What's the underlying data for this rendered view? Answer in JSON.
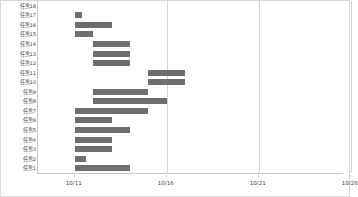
{
  "chart_data": {
    "type": "bar",
    "title": "",
    "subtitle": "",
    "xlabel": "",
    "ylabel": "",
    "orientation": "horizontal",
    "style": "gantt",
    "grid": "vertical-only",
    "legend": "none",
    "bar_color": "#6e6e6e",
    "grid_color": "#d5d5d5",
    "axis_color": "#c8c8c8",
    "background": "#ffffff",
    "x_axis": {
      "tick_labels": [
        "10/11",
        "10/16",
        "10/21",
        "10/26"
      ],
      "tick_day_offsets": [
        0,
        5,
        10,
        15
      ],
      "range_days": [
        -2,
        16.6
      ],
      "pixels_per_day": 18.4
    },
    "categories": [
      "任务18",
      "任务17",
      "任务16",
      "任务15",
      "任务14",
      "任务13",
      "任务12",
      "任务11",
      "任务10",
      "任务9",
      "任务8",
      "任务7",
      "任务6",
      "任务5",
      "任务4",
      "任务3",
      "任务2",
      "任务1"
    ],
    "bars": [
      {
        "category": "任务18",
        "start_day": 0.0,
        "end_day": 0.0,
        "duration_days": 0.0
      },
      {
        "category": "任务17",
        "start_day": 0.0,
        "end_day": 0.4,
        "duration_days": 0.4
      },
      {
        "category": "任务16",
        "start_day": 0.0,
        "end_day": 2.0,
        "duration_days": 2.0
      },
      {
        "category": "任务15",
        "start_day": 0.0,
        "end_day": 1.0,
        "duration_days": 1.0
      },
      {
        "category": "任务14",
        "start_day": 1.0,
        "end_day": 3.0,
        "duration_days": 2.0
      },
      {
        "category": "任务13",
        "start_day": 1.0,
        "end_day": 3.0,
        "duration_days": 2.0
      },
      {
        "category": "任务12",
        "start_day": 1.0,
        "end_day": 3.0,
        "duration_days": 2.0
      },
      {
        "category": "任务11",
        "start_day": 4.0,
        "end_day": 6.0,
        "duration_days": 2.0
      },
      {
        "category": "任务10",
        "start_day": 4.0,
        "end_day": 6.0,
        "duration_days": 2.0
      },
      {
        "category": "任务9",
        "start_day": 1.0,
        "end_day": 4.0,
        "duration_days": 3.0
      },
      {
        "category": "任务8",
        "start_day": 1.0,
        "end_day": 5.0,
        "duration_days": 4.0
      },
      {
        "category": "任务7",
        "start_day": 0.0,
        "end_day": 4.0,
        "duration_days": 4.0
      },
      {
        "category": "任务6",
        "start_day": 0.0,
        "end_day": 2.0,
        "duration_days": 2.0
      },
      {
        "category": "任务5",
        "start_day": 0.0,
        "end_day": 3.0,
        "duration_days": 3.0
      },
      {
        "category": "任务4",
        "start_day": 0.0,
        "end_day": 2.0,
        "duration_days": 2.0
      },
      {
        "category": "任务3",
        "start_day": 0.0,
        "end_day": 2.0,
        "duration_days": 2.0
      },
      {
        "category": "任务2",
        "start_day": 0.0,
        "end_day": 0.6,
        "duration_days": 0.6
      },
      {
        "category": "任务1",
        "start_day": 0.0,
        "end_day": 3.0,
        "duration_days": 3.0
      }
    ]
  }
}
